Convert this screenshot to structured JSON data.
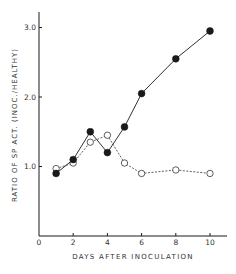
{
  "chart_data": {
    "type": "line",
    "title": "",
    "xlabel": "DAYS AFTER INOCULATION",
    "ylabel": "RATIO OF SP ACT. (INOC./HEALTHY)",
    "xlim": [
      0,
      11
    ],
    "ylim": [
      0,
      3.2
    ],
    "x_ticks": [
      0,
      2,
      4,
      6,
      8,
      10
    ],
    "x_tick_labels": [
      "0",
      "2",
      "4",
      "6",
      "8",
      "10"
    ],
    "y_ticks": [
      1.0,
      2.0,
      3.0
    ],
    "y_tick_labels": [
      "1.0",
      "2.0",
      "3.0"
    ],
    "grid": false,
    "legend": "none",
    "series": [
      {
        "name": "filled circles (solid line)",
        "marker": "filled-circle",
        "line": "solid",
        "x": [
          1,
          2,
          3,
          4,
          5,
          6,
          8,
          10
        ],
        "y": [
          0.9,
          1.1,
          1.5,
          1.2,
          1.57,
          2.05,
          2.55,
          2.95
        ]
      },
      {
        "name": "open circles (dashed line)",
        "marker": "open-circle",
        "line": "dashed",
        "x": [
          1,
          2,
          3,
          4,
          5,
          6,
          8,
          10
        ],
        "y": [
          0.97,
          1.05,
          1.35,
          1.45,
          1.05,
          0.9,
          0.95,
          0.9
        ]
      }
    ]
  },
  "colors": {
    "ink": "#1a1a1a",
    "background": "#ffffff"
  }
}
